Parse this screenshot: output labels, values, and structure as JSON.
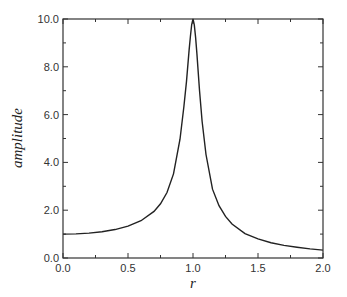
{
  "chart_data": {
    "type": "line",
    "title": "",
    "xlabel": "r",
    "ylabel": "amplitude",
    "xlim": [
      0.0,
      2.0
    ],
    "ylim": [
      0.0,
      10.0
    ],
    "grid": false,
    "legend": null,
    "x_ticks": [
      "0.0",
      "0.5",
      "1.0",
      "1.5",
      "2.0"
    ],
    "y_ticks": [
      "0.0",
      "2.0",
      "4.0",
      "6.0",
      "8.0",
      "10.0"
    ],
    "series": [
      {
        "name": "amplitude",
        "x": [
          0.0,
          0.1,
          0.2,
          0.3,
          0.4,
          0.5,
          0.6,
          0.7,
          0.75,
          0.8,
          0.85,
          0.9,
          0.93,
          0.95,
          0.97,
          0.98,
          0.99,
          1.0,
          1.01,
          1.02,
          1.03,
          1.05,
          1.07,
          1.1,
          1.15,
          1.2,
          1.25,
          1.3,
          1.4,
          1.5,
          1.6,
          1.7,
          1.8,
          1.9,
          2.0
        ],
        "values": [
          1.0,
          1.01,
          1.04,
          1.1,
          1.19,
          1.33,
          1.56,
          1.95,
          2.27,
          2.74,
          3.52,
          4.97,
          6.34,
          7.39,
          8.7,
          9.27,
          9.77,
          10.0,
          9.75,
          9.23,
          8.55,
          7.02,
          5.72,
          4.33,
          2.88,
          2.19,
          1.74,
          1.42,
          1.02,
          0.8,
          0.64,
          0.53,
          0.45,
          0.38,
          0.33
        ]
      }
    ]
  }
}
